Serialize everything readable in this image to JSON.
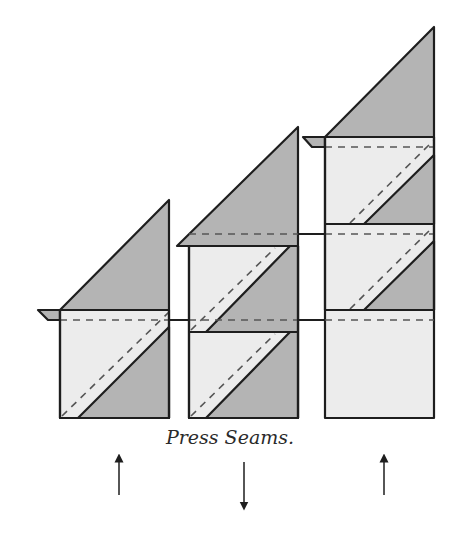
{
  "caption": "Press Seams.",
  "colors": {
    "dark_fabric": "#b4b4b4",
    "light_fabric": "#ececec",
    "outline": "#1e1e1e",
    "seam": "#555555"
  },
  "columns": [
    {
      "id": "left",
      "blocks": 1,
      "press_direction": "up"
    },
    {
      "id": "middle",
      "blocks": 2,
      "press_direction": "down"
    },
    {
      "id": "right",
      "blocks": 3,
      "press_direction": "up"
    }
  ],
  "arrows": [
    {
      "column": "left",
      "direction": "up"
    },
    {
      "column": "middle",
      "direction": "down"
    },
    {
      "column": "right",
      "direction": "up"
    }
  ]
}
